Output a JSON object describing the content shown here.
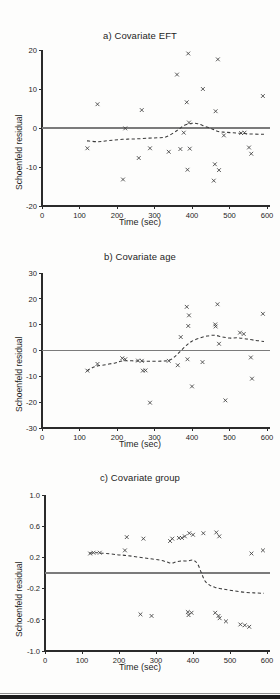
{
  "figure": {
    "background_color": "#fdfdfc",
    "axis_color": "#2b2b2b",
    "zero_line_color": "#7b7b7b",
    "smooth_line_color": "#3a3a3a",
    "marker_color": "#3d3d3d",
    "bottom_rule_color": "#1b1b1b",
    "shared_xlabel": "Time (sec)",
    "shared_ylabel": "Schoenfeld residual"
  },
  "panels": [
    {
      "id": "a",
      "title": "a) Covariate EFT",
      "xlabel": "Time (sec)",
      "ylabel": "Schoenfeld residual"
    },
    {
      "id": "b",
      "title": "b) Covariate age",
      "xlabel": "Time (sec)",
      "ylabel": "Schoenfeld residual"
    },
    {
      "id": "c",
      "title": "c) Covariate group",
      "xlabel": "Time (sec)",
      "ylabel": "Schoenfeld residual"
    }
  ],
  "chart_data": [
    {
      "type": "scatter",
      "id": "a",
      "title": "a) Covariate EFT",
      "xlabel": "Time (sec)",
      "ylabel": "Schoenfeld residual",
      "xlim": [
        0,
        600
      ],
      "ylim": [
        -20,
        20
      ],
      "xticks": [
        0,
        100,
        200,
        300,
        400,
        500,
        600
      ],
      "yticks": [
        -20,
        -10,
        0,
        10,
        20
      ],
      "ytick_labels": [
        "-20",
        "-10",
        "0",
        "10",
        "20"
      ],
      "grid": false,
      "legend": "none",
      "reference_line_y": 0,
      "points": [
        {
          "x": 121,
          "y": -5.2
        },
        {
          "x": 148,
          "y": 6.1
        },
        {
          "x": 216,
          "y": -13.2
        },
        {
          "x": 222,
          "y": -0.1
        },
        {
          "x": 258,
          "y": -7.7
        },
        {
          "x": 266,
          "y": 4.6
        },
        {
          "x": 288,
          "y": -5.2
        },
        {
          "x": 338,
          "y": -6.1
        },
        {
          "x": 360,
          "y": 13.7
        },
        {
          "x": 369,
          "y": -5.4
        },
        {
          "x": 378,
          "y": -1.2
        },
        {
          "x": 386,
          "y": 6.6
        },
        {
          "x": 388,
          "y": -10.7
        },
        {
          "x": 390,
          "y": 19.1
        },
        {
          "x": 392,
          "y": 1.4
        },
        {
          "x": 394,
          "y": -5.3
        },
        {
          "x": 429,
          "y": 10.0
        },
        {
          "x": 458,
          "y": -13.5
        },
        {
          "x": 461,
          "y": -9.3
        },
        {
          "x": 463,
          "y": 4.3
        },
        {
          "x": 469,
          "y": 17.6
        },
        {
          "x": 472,
          "y": -10.8
        },
        {
          "x": 485,
          "y": -1.9
        },
        {
          "x": 531,
          "y": -1.3
        },
        {
          "x": 540,
          "y": -1.2
        },
        {
          "x": 552,
          "y": -5.0
        },
        {
          "x": 558,
          "y": -6.6
        },
        {
          "x": 589,
          "y": 8.2
        }
      ],
      "smooth_curve": [
        {
          "x": 120,
          "y": -3.3
        },
        {
          "x": 150,
          "y": -3.5
        },
        {
          "x": 180,
          "y": -3.2
        },
        {
          "x": 215,
          "y": -2.9
        },
        {
          "x": 250,
          "y": -2.8
        },
        {
          "x": 285,
          "y": -2.6
        },
        {
          "x": 310,
          "y": -2.5
        },
        {
          "x": 330,
          "y": -2.3
        },
        {
          "x": 350,
          "y": -1.3
        },
        {
          "x": 365,
          "y": -0.3
        },
        {
          "x": 380,
          "y": 0.7
        },
        {
          "x": 400,
          "y": 1.2
        },
        {
          "x": 415,
          "y": 1.1
        },
        {
          "x": 435,
          "y": 0.4
        },
        {
          "x": 455,
          "y": -0.3
        },
        {
          "x": 470,
          "y": -0.9
        },
        {
          "x": 490,
          "y": -1.1
        },
        {
          "x": 520,
          "y": -1.3
        },
        {
          "x": 550,
          "y": -1.5
        },
        {
          "x": 580,
          "y": -1.6
        },
        {
          "x": 592,
          "y": -1.6
        }
      ]
    },
    {
      "type": "scatter",
      "id": "b",
      "title": "b) Covariate age",
      "xlabel": "Time (sec)",
      "ylabel": "Schoenfeld residual",
      "xlim": [
        0,
        600
      ],
      "ylim": [
        -30,
        30
      ],
      "xticks": [
        0,
        100,
        200,
        300,
        400,
        500,
        600
      ],
      "yticks": [
        -30,
        -20,
        -10,
        0,
        10,
        20,
        30
      ],
      "ytick_labels": [
        "-30",
        "-20",
        "-10",
        "0",
        "10",
        "20",
        "30"
      ],
      "grid": false,
      "legend": "none",
      "reference_line_y": 0,
      "points": [
        {
          "x": 121,
          "y": -7.8
        },
        {
          "x": 148,
          "y": -5.2
        },
        {
          "x": 214,
          "y": -3.0
        },
        {
          "x": 222,
          "y": -3.4
        },
        {
          "x": 256,
          "y": -3.9
        },
        {
          "x": 266,
          "y": -4.0
        },
        {
          "x": 269,
          "y": -7.8
        },
        {
          "x": 276,
          "y": -7.7
        },
        {
          "x": 288,
          "y": -20.2
        },
        {
          "x": 338,
          "y": -4.0
        },
        {
          "x": 362,
          "y": -5.7
        },
        {
          "x": 370,
          "y": 5.2
        },
        {
          "x": 386,
          "y": 16.9
        },
        {
          "x": 388,
          "y": -3.4
        },
        {
          "x": 390,
          "y": 9.5
        },
        {
          "x": 392,
          "y": 13.6
        },
        {
          "x": 400,
          "y": -13.9
        },
        {
          "x": 428,
          "y": -4.5
        },
        {
          "x": 462,
          "y": 10.1
        },
        {
          "x": 463,
          "y": 9.3
        },
        {
          "x": 468,
          "y": 17.9
        },
        {
          "x": 472,
          "y": 2.6
        },
        {
          "x": 489,
          "y": -19.3
        },
        {
          "x": 528,
          "y": 6.9
        },
        {
          "x": 538,
          "y": 6.4
        },
        {
          "x": 557,
          "y": -2.7
        },
        {
          "x": 560,
          "y": -10.9
        },
        {
          "x": 589,
          "y": 14.2
        }
      ],
      "smooth_curve": [
        {
          "x": 120,
          "y": -7.9
        },
        {
          "x": 140,
          "y": -6.3
        },
        {
          "x": 165,
          "y": -5.6
        },
        {
          "x": 195,
          "y": -4.8
        },
        {
          "x": 215,
          "y": -4.0
        },
        {
          "x": 240,
          "y": -4.0
        },
        {
          "x": 265,
          "y": -4.1
        },
        {
          "x": 290,
          "y": -4.2
        },
        {
          "x": 320,
          "y": -4.1
        },
        {
          "x": 340,
          "y": -3.8
        },
        {
          "x": 355,
          "y": -2.3
        },
        {
          "x": 370,
          "y": -0.1
        },
        {
          "x": 385,
          "y": 2.0
        },
        {
          "x": 400,
          "y": 3.6
        },
        {
          "x": 420,
          "y": 4.8
        },
        {
          "x": 440,
          "y": 5.6
        },
        {
          "x": 460,
          "y": 5.9
        },
        {
          "x": 480,
          "y": 5.3
        },
        {
          "x": 500,
          "y": 4.8
        },
        {
          "x": 520,
          "y": 4.9
        },
        {
          "x": 540,
          "y": 4.6
        },
        {
          "x": 565,
          "y": 4.0
        },
        {
          "x": 592,
          "y": 3.5
        }
      ]
    },
    {
      "type": "scatter",
      "id": "c",
      "title": "c) Covariate group",
      "xlabel": "Time (sec)",
      "ylabel": "Schoenfeld residual",
      "xlim": [
        0,
        600
      ],
      "ylim": [
        -1.0,
        1.0
      ],
      "xticks": [
        0,
        100,
        200,
        300,
        400,
        500,
        600
      ],
      "yticks": [
        -1.0,
        -0.6,
        -0.2,
        0.2,
        0.6,
        1.0
      ],
      "ytick_labels": [
        "-1.0",
        "-0.6",
        "-0.2",
        "0.2",
        "0.6",
        "1.0"
      ],
      "grid": false,
      "legend": "none",
      "reference_line_y": 0,
      "points": [
        {
          "x": 122,
          "y": 0.25
        },
        {
          "x": 131,
          "y": 0.26
        },
        {
          "x": 148,
          "y": 0.26
        },
        {
          "x": 216,
          "y": 0.29
        },
        {
          "x": 221,
          "y": 0.46
        },
        {
          "x": 258,
          "y": -0.53
        },
        {
          "x": 266,
          "y": 0.44
        },
        {
          "x": 288,
          "y": -0.55
        },
        {
          "x": 338,
          "y": 0.41
        },
        {
          "x": 344,
          "y": 0.44
        },
        {
          "x": 362,
          "y": 0.45
        },
        {
          "x": 370,
          "y": 0.45
        },
        {
          "x": 378,
          "y": 0.47
        },
        {
          "x": 386,
          "y": -0.5
        },
        {
          "x": 388,
          "y": -0.54
        },
        {
          "x": 390,
          "y": 0.51
        },
        {
          "x": 396,
          "y": -0.51
        },
        {
          "x": 400,
          "y": 0.49
        },
        {
          "x": 428,
          "y": 0.51
        },
        {
          "x": 460,
          "y": -0.51
        },
        {
          "x": 463,
          "y": 0.52
        },
        {
          "x": 469,
          "y": -0.55
        },
        {
          "x": 471,
          "y": 0.47
        },
        {
          "x": 472,
          "y": -0.58
        },
        {
          "x": 489,
          "y": -0.62
        },
        {
          "x": 528,
          "y": -0.66
        },
        {
          "x": 540,
          "y": -0.67
        },
        {
          "x": 552,
          "y": -0.69
        },
        {
          "x": 558,
          "y": 0.25
        },
        {
          "x": 589,
          "y": 0.29
        }
      ],
      "smooth_curve": [
        {
          "x": 120,
          "y": 0.255
        },
        {
          "x": 140,
          "y": 0.26
        },
        {
          "x": 165,
          "y": 0.25
        },
        {
          "x": 195,
          "y": 0.235
        },
        {
          "x": 220,
          "y": 0.225
        },
        {
          "x": 250,
          "y": 0.205
        },
        {
          "x": 280,
          "y": 0.185
        },
        {
          "x": 310,
          "y": 0.165
        },
        {
          "x": 330,
          "y": 0.14
        },
        {
          "x": 342,
          "y": 0.125
        },
        {
          "x": 355,
          "y": 0.145
        },
        {
          "x": 370,
          "y": 0.155
        },
        {
          "x": 385,
          "y": 0.155
        },
        {
          "x": 400,
          "y": 0.165
        },
        {
          "x": 412,
          "y": 0.12
        },
        {
          "x": 422,
          "y": 0.01
        },
        {
          "x": 432,
          "y": -0.1
        },
        {
          "x": 445,
          "y": -0.155
        },
        {
          "x": 460,
          "y": -0.185
        },
        {
          "x": 480,
          "y": -0.205
        },
        {
          "x": 505,
          "y": -0.225
        },
        {
          "x": 535,
          "y": -0.245
        },
        {
          "x": 565,
          "y": -0.255
        },
        {
          "x": 592,
          "y": -0.26
        }
      ]
    }
  ]
}
